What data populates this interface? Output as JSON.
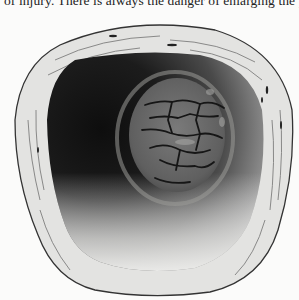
{
  "page": {
    "text_lines": [
      "of injury.  There is always the danger of enlarging the perfor"
    ]
  },
  "figure": {
    "colors": {
      "background": "#fbfbfa",
      "ring_fill": "#e2e2e0",
      "ring_stroke": "#3a3a3a",
      "cavity_dark": "#141414",
      "cavity_mid": "#5a5a5a",
      "cavity_light": "#d8d8d6",
      "lesion_fill": "#6e6e6e",
      "crack": "#1a1a1a"
    }
  }
}
